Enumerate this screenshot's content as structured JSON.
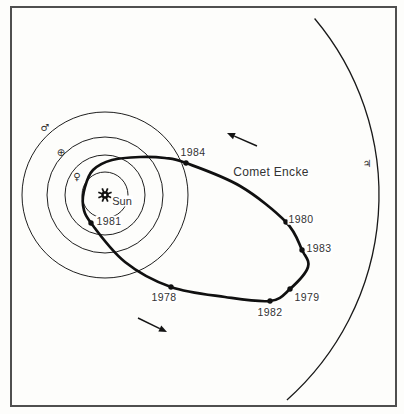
{
  "figure": {
    "background_color": "#fdfdfb",
    "ink_color": "#101010",
    "frame_color": "#4f4f4f"
  },
  "labels": {
    "sun": {
      "text": "Sun",
      "pos": [
        122,
        201
      ]
    },
    "comet": {
      "text": "Comet Encke",
      "pos": [
        271,
        172
      ]
    },
    "years": [
      {
        "text": "1984",
        "pos": [
          193,
          152
        ]
      },
      {
        "text": "1981",
        "pos": [
          109,
          221
        ]
      },
      {
        "text": "1978",
        "pos": [
          164,
          297
        ]
      },
      {
        "text": "1982",
        "pos": [
          270,
          312
        ]
      },
      {
        "text": "1979",
        "pos": [
          307,
          297
        ]
      },
      {
        "text": "1983",
        "pos": [
          319,
          248
        ]
      },
      {
        "text": "1980",
        "pos": [
          301,
          219
        ]
      }
    ],
    "planets": [
      {
        "name": "mars",
        "symbol": "♂",
        "pos": [
          45,
          128
        ]
      },
      {
        "name": "earth",
        "symbol": "⊕",
        "pos": [
          61,
          153
        ]
      },
      {
        "name": "venus",
        "symbol": "♀",
        "pos": [
          77,
          177
        ]
      },
      {
        "name": "jupiter",
        "symbol": "♃",
        "pos": [
          367,
          164
        ]
      }
    ]
  },
  "diagram": {
    "canvas": [
      404,
      414
    ],
    "sun_center": [
      105,
      195
    ],
    "planet_orbit_radii": [
      23,
      40,
      58,
      83
    ],
    "jupiter_arc": {
      "radius": 274,
      "start_angle_deg": -40.1,
      "end_angle_deg": 48.4
    },
    "comet_orbit_points": [
      [
        93,
        170
      ],
      [
        112,
        160
      ],
      [
        140,
        157
      ],
      [
        165,
        158
      ],
      [
        186,
        163
      ],
      [
        240,
        186
      ],
      [
        286,
        222
      ],
      [
        302,
        250
      ],
      [
        308,
        267
      ],
      [
        290,
        289
      ],
      [
        270,
        301
      ],
      [
        225,
        297
      ],
      [
        171,
        287
      ],
      [
        125,
        262
      ],
      [
        91,
        223
      ],
      [
        83,
        205
      ],
      [
        85,
        187
      ]
    ],
    "orbit_dots": [
      [
        186,
        163
      ],
      [
        91,
        223
      ],
      [
        171,
        287
      ],
      [
        270,
        301
      ],
      [
        290,
        289
      ],
      [
        302,
        250
      ],
      [
        286,
        222
      ]
    ],
    "arrows": [
      {
        "from": [
          257,
          146
        ],
        "to": [
          227,
          133
        ]
      },
      {
        "from": [
          138,
          318
        ],
        "to": [
          167,
          332
        ]
      }
    ]
  }
}
